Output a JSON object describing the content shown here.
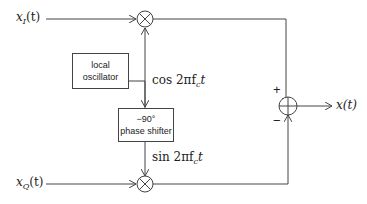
{
  "diagram": {
    "type": "IQ modulator block diagram",
    "inputs": {
      "in_phase": "x_I(t)",
      "quadrature": "x_Q(t)"
    },
    "output": "x(t)",
    "blocks": {
      "local_oscillator": {
        "line1": "local",
        "line2": "oscillator"
      },
      "phase_shifter": {
        "line1": "−90°",
        "line2": "phase shifter"
      }
    },
    "signals": {
      "cos": "cos 2πf",
      "cos_sub": "c",
      "cos_t": "t",
      "sin": "sin 2πf",
      "sin_sub": "c",
      "sin_t": "t"
    },
    "summer_signs": {
      "plus": "+",
      "minus": "−"
    },
    "labels": {
      "xI_main": "x",
      "xI_sub": "I",
      "xI_arg": "(t)",
      "xQ_main": "x",
      "xQ_sub": "Q",
      "xQ_arg": "(t)",
      "out": "x(t)"
    }
  }
}
